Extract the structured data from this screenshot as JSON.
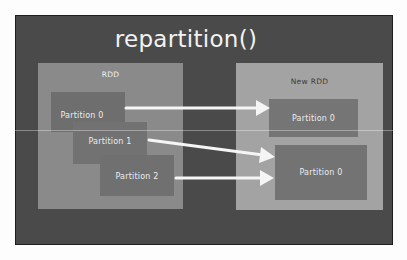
{
  "diagram": {
    "title": "repartition()",
    "source_rdd": {
      "label": "RDD",
      "partitions": [
        "Partition 0",
        "Partition 1",
        "Partition 2"
      ]
    },
    "target_rdd": {
      "label": "New RDD",
      "partitions": [
        "Partition 0",
        "Partition 0"
      ]
    },
    "arrows": [
      {
        "from": "Partition 0",
        "to": "New RDD Partition 0 (top)"
      },
      {
        "from": "Partition 1",
        "to": "New RDD Partition 0 (bottom)"
      },
      {
        "from": "Partition 2",
        "to": "New RDD Partition 0 (bottom)"
      }
    ],
    "colors": {
      "slide_background": "#4a4a4a",
      "rdd_box": "#8a8a8a",
      "new_rdd_box": "#a3a3a3",
      "partition_box": "#6e6e6e",
      "text": "#f2f2f2",
      "arrow": "#f5f5f5"
    }
  }
}
